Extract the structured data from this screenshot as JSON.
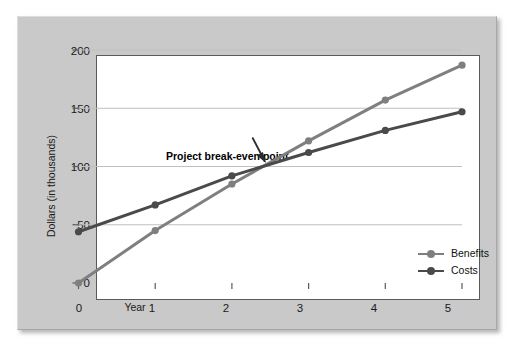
{
  "chart_data": {
    "type": "line",
    "title": "",
    "xlabel": "Year",
    "ylabel": "Dollars (in thousands)",
    "x": [
      0,
      1,
      2,
      3,
      4,
      5
    ],
    "xticklabels": [
      "0",
      "1",
      "2",
      "3",
      "4",
      "5"
    ],
    "yticks": [
      0,
      50,
      100,
      150,
      200
    ],
    "yticklabels": [
      "0",
      "50",
      "100",
      "150",
      "200"
    ],
    "xlim": [
      0,
      5
    ],
    "ylim": [
      0,
      210
    ],
    "grid": "horizontal",
    "legend_position": "inside-lower-right",
    "series": [
      {
        "name": "Benefits",
        "color": "#7f7f7f",
        "values": [
          0,
          45,
          85,
          122,
          157,
          187
        ]
      },
      {
        "name": "Costs",
        "color": "#4a4a4a",
        "values": [
          44,
          67,
          92,
          112,
          131,
          147
        ]
      }
    ],
    "annotations": [
      {
        "text": "Project break-even point",
        "x": 2.45,
        "y": 100,
        "arrow": "down-right"
      }
    ]
  },
  "legend": {
    "items": [
      {
        "label": "Benefits",
        "color": "#7f7f7f"
      },
      {
        "label": "Costs",
        "color": "#4a4a4a"
      }
    ]
  },
  "colors": {
    "panel_background": "#c9c9c9",
    "plot_background": "#ffffff",
    "axis": "#5a5a5a",
    "grid": "#c0c0c0",
    "benefits": "#7f7f7f",
    "costs": "#4a4a4a",
    "text": "#1a1a1a"
  }
}
